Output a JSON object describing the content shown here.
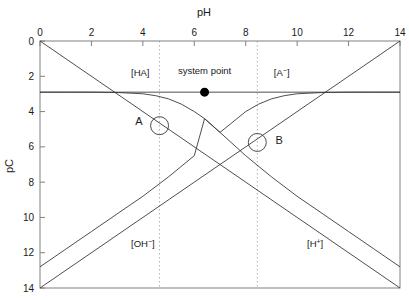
{
  "chart_data": {
    "type": "line",
    "title": "",
    "xlabel": "pH",
    "ylabel": "pC",
    "xlim": [
      0,
      14
    ],
    "ylim": [
      14,
      0
    ],
    "x_axis_position": "top",
    "y_axis_direction": "inverted",
    "grid": false,
    "legend": "inline-labels",
    "xticks": [
      0,
      2,
      4,
      6,
      8,
      10,
      12,
      14
    ],
    "xticklabels": [
      "0",
      "2",
      "4",
      "6",
      "8",
      "10",
      "12",
      "14"
    ],
    "yticks": [
      0,
      2,
      4,
      6,
      8,
      10,
      12,
      14
    ],
    "yticklabels": [
      "0",
      "2",
      "4",
      "6",
      "8",
      "10",
      "12",
      "14"
    ],
    "constants": {
      "CT_pC": 2.9,
      "pKa": 6.4,
      "pKw": 14
    },
    "series": [
      {
        "name": "[H+]",
        "label": "[H",
        "label_sup": "+",
        "label_close": "]",
        "label_x": 10.7,
        "label_y": 11.7,
        "type": "straight",
        "points": [
          [
            0,
            0
          ],
          [
            14,
            14
          ]
        ]
      },
      {
        "name": "[OH-]",
        "label": "[OH",
        "label_sup": "−",
        "label_close": "]",
        "label_x": 4.0,
        "label_y": 11.7,
        "type": "straight",
        "points": [
          [
            0,
            14
          ],
          [
            14,
            0
          ]
        ]
      },
      {
        "name": "[HA]",
        "label": "[HA]",
        "label_sup": "",
        "label_close": "",
        "label_x": 3.9,
        "label_y": 2.0,
        "type": "curve",
        "points": [
          [
            0,
            2.9
          ],
          [
            1,
            2.9
          ],
          [
            2,
            2.9
          ],
          [
            3,
            2.92
          ],
          [
            4,
            2.99
          ],
          [
            4.5,
            3.1
          ],
          [
            5,
            3.28
          ],
          [
            5.5,
            3.58
          ],
          [
            6,
            4.0
          ],
          [
            6.4,
            4.4
          ],
          [
            7,
            5.18
          ],
          [
            8,
            6.5
          ],
          [
            9,
            7.7
          ],
          [
            10,
            8.8
          ],
          [
            11,
            9.8
          ],
          [
            12,
            10.8
          ],
          [
            13,
            11.8
          ],
          [
            14,
            12.8
          ]
        ]
      },
      {
        "name": "[A-]",
        "label": "[A",
        "label_sup": "−",
        "label_close": "]",
        "label_x": 9.4,
        "label_y": 2.0,
        "type": "curve",
        "points": [
          [
            0,
            12.8
          ],
          [
            1,
            11.8
          ],
          [
            2,
            10.8
          ],
          [
            3,
            9.8
          ],
          [
            4,
            8.8
          ],
          [
            5,
            7.7
          ],
          [
            6,
            6.5
          ],
          [
            6.4,
            4.4
          ],
          [
            7,
            5.18
          ],
          [
            8,
            4.0
          ],
          [
            8.5,
            3.58
          ],
          [
            9,
            3.28
          ],
          [
            9.5,
            3.1
          ],
          [
            10,
            2.99
          ],
          [
            11,
            2.92
          ],
          [
            12,
            2.9
          ],
          [
            13,
            2.9
          ],
          [
            14,
            2.9
          ]
        ]
      },
      {
        "name": "CT",
        "label": "",
        "label_sup": "",
        "label_close": "",
        "type": "straight",
        "points": [
          [
            0,
            2.9
          ],
          [
            14,
            2.9
          ]
        ]
      }
    ],
    "annotations": [
      {
        "name": "system-point",
        "label": "system point",
        "x": 6.4,
        "y": 2.9,
        "marker": "filled-circle",
        "label_x": 6.4,
        "label_y": 1.85
      },
      {
        "name": "point-a",
        "label": "A",
        "x": 4.65,
        "y": 4.8,
        "marker": "open-circle",
        "label_x": 3.85,
        "label_y": 4.75
      },
      {
        "name": "point-b",
        "label": "B",
        "x": 8.45,
        "y": 5.75,
        "marker": "open-circle",
        "label_x": 9.3,
        "label_y": 5.85
      }
    ],
    "dropline_x": [
      4.65,
      8.45
    ]
  },
  "colors": {
    "axis": "#808080",
    "curve": "#3a3a3a",
    "text": "#1a1a1a",
    "marker_fill": "#000000",
    "dropline": "#b0b0b0",
    "background": "#ffffff"
  }
}
